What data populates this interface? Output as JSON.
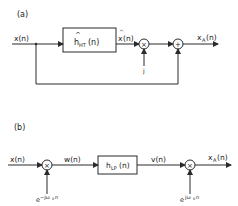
{
  "diagram_a": {
    "label": "(a)",
    "input": "x(n)",
    "filter": {
      "hat": "^",
      "base": "h",
      "sub": "HT",
      "arg": "(n)"
    },
    "filter_output": {
      "hat": "^",
      "base": "x",
      "arg": "(n)"
    },
    "multiplier_symbol": "×",
    "multiplier_input": "j",
    "adder_symbol": "+",
    "output": {
      "base": "x",
      "sub": "A",
      "arg": "(n)"
    }
  },
  "diagram_b": {
    "label": "(b)",
    "input": "x(n)",
    "mixer1_symbol": "×",
    "mixer1_input": {
      "base": "e",
      "sup": "−jω",
      "sup_sub": "0",
      "sup_tail": "n"
    },
    "intermediate1": "w(n)",
    "filter": {
      "base": "h",
      "sub": "LP",
      "arg": "(n)"
    },
    "intermediate2": "v(n)",
    "mixer2_symbol": "×",
    "mixer2_input": {
      "base": "e",
      "sup": "jω",
      "sup_sub": "0",
      "sup_tail": "n"
    },
    "output": {
      "base": "x",
      "sub": "A",
      "arg": "(n)"
    }
  },
  "colors": {
    "line": "#2a2a2a",
    "background": "#ffffff"
  }
}
